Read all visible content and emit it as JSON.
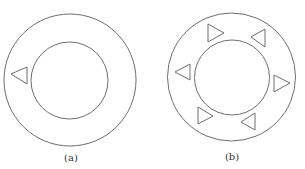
{
  "figures": [
    {
      "id": "a",
      "caption": "(a)",
      "outer_circle": {
        "cx": 70,
        "cy": 80,
        "r": 66
      },
      "inner_circle": {
        "cx": 69.5,
        "cy": 80.5,
        "r": 38.5
      },
      "triangles": [
        {
          "direction": "left",
          "points": "11,74 27,67 27,84"
        }
      ],
      "caption_pos": {
        "x": 71,
        "y": 161
      }
    },
    {
      "id": "b",
      "caption": "(b)",
      "outer_circle": {
        "cx": 231.5,
        "cy": 77,
        "r": 64
      },
      "inner_circle": {
        "cx": 232,
        "cy": 77.5,
        "r": 37.5
      },
      "triangles": [
        {
          "direction": "right",
          "points": "208,24 208,42 224,33"
        },
        {
          "direction": "left",
          "points": "251,37 265,29 265,47"
        },
        {
          "direction": "left",
          "points": "175,72 190,64 190,80"
        },
        {
          "direction": "right",
          "points": "274,75 274,92 290,83"
        },
        {
          "direction": "right",
          "points": "198,107 198,124 213,116"
        },
        {
          "direction": "left",
          "points": "241,122 255,113 255,130"
        }
      ],
      "caption_pos": {
        "x": 232,
        "y": 160
      }
    }
  ],
  "colors": {
    "stroke": "#6e6e6e",
    "background": "#ffffff"
  }
}
